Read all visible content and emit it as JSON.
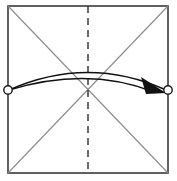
{
  "figure": {
    "width": 181,
    "height": 181,
    "background_color": "#ffffff"
  },
  "paper": {
    "shape_name": "square-sheet",
    "edge_color": "#3a3a3a",
    "edge_width": 1.6,
    "fill_color": "#ffffff",
    "left": 8,
    "top": 6,
    "right": 168,
    "bottom": 173
  },
  "creases": {
    "diagonal_color": "#8a8a8a",
    "diagonal_width": 1.1,
    "diagonals": [
      {
        "name": "diagonal-tl-br",
        "x1": 8,
        "y1": 6,
        "x2": 168,
        "y2": 173
      },
      {
        "name": "diagonal-tr-bl",
        "x1": 168,
        "y1": 6,
        "x2": 8,
        "y2": 173
      }
    ],
    "fold_line": {
      "name": "vertical-center-fold-line",
      "style": "dashed",
      "color": "#3a3a3a",
      "width": 1.5,
      "dash_pattern": "7 5",
      "x": 88,
      "y1": 6,
      "y2": 173
    }
  },
  "arrow": {
    "name": "fold-arrow",
    "color": "#111111",
    "stroke_width": 1.5,
    "style": "double-line-curved",
    "start_point": {
      "x": 9,
      "y": 90
    },
    "end_point": {
      "x": 166,
      "y": 90
    },
    "upper_arc_control": {
      "x": 88,
      "y": 55
    },
    "lower_arc_control": {
      "x": 88,
      "y": 66
    },
    "arrowhead": {
      "name": "arrowhead-filled-triangle",
      "fill": "#111111",
      "points": "141,77 166,93 146,94"
    }
  },
  "markers": [
    {
      "name": "reference-point-left",
      "label": "left edge midpoint",
      "cx": 8,
      "cy": 90,
      "r": 4.2,
      "stroke": "#1a1a1a",
      "stroke_width": 1.4,
      "fill": "#ffffff"
    },
    {
      "name": "reference-point-right",
      "label": "right edge midpoint",
      "cx": 168,
      "cy": 90,
      "r": 4.2,
      "stroke": "#1a1a1a",
      "stroke_width": 1.4,
      "fill": "#ffffff"
    }
  ]
}
